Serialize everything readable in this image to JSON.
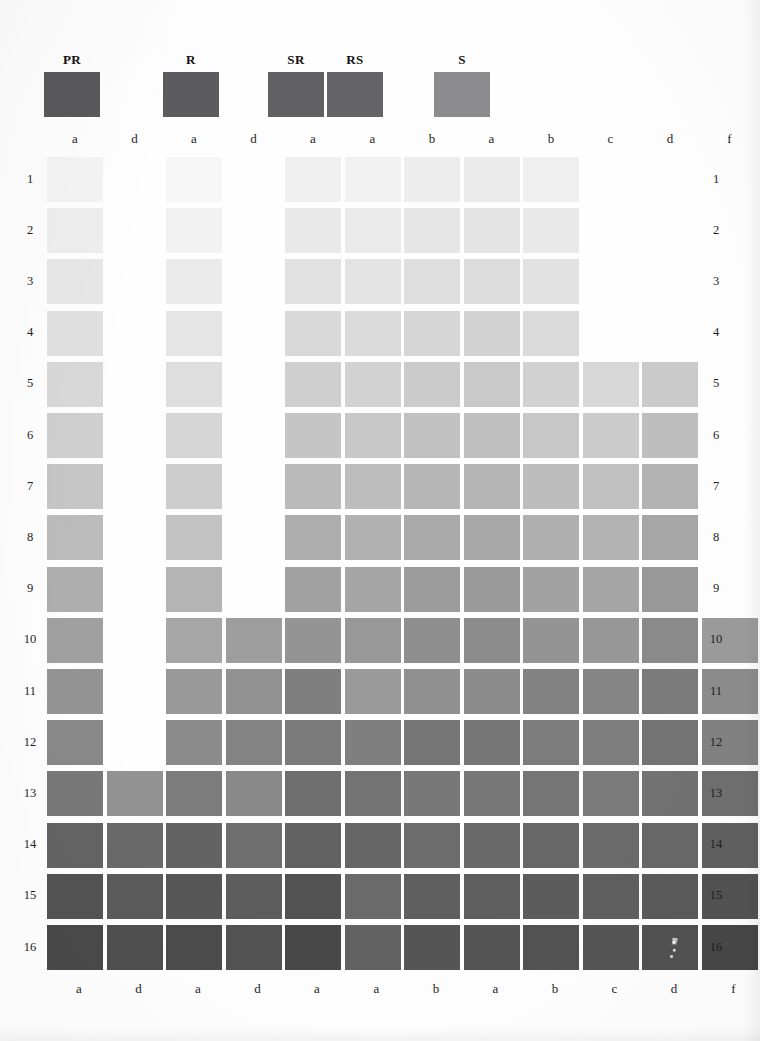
{
  "page": {
    "background": "#fefefe"
  },
  "header": {
    "swatches": [
      {
        "label": "PR",
        "color": "#59595b",
        "x": 44,
        "y": 72,
        "width": 56,
        "height": 45
      },
      {
        "label": "R",
        "color": "#5c5c5e",
        "x": 163,
        "y": 72,
        "width": 56,
        "height": 45
      },
      {
        "label": "SR",
        "color": "#616163",
        "x": 268,
        "y": 72,
        "width": 56,
        "height": 45
      },
      {
        "label": "RS",
        "color": "#646466",
        "x": 327,
        "y": 72,
        "width": 56,
        "height": 45
      },
      {
        "label": "S",
        "color": "#8c8c8e",
        "x": 434,
        "y": 72,
        "width": 56,
        "height": 45
      }
    ]
  },
  "grid": {
    "origin_x": 47,
    "origin_y": 157,
    "cell_width": 56,
    "cell_height": 45,
    "col_pitch": 59.5,
    "row_pitch": 51.2,
    "columns": [
      {
        "index": 1,
        "label": "a"
      },
      {
        "index": 2,
        "label": "d"
      },
      {
        "index": 3,
        "label": "a"
      },
      {
        "index": 4,
        "label": "d"
      },
      {
        "index": 5,
        "label": "a"
      },
      {
        "index": 6,
        "label": "a"
      },
      {
        "index": 7,
        "label": "b"
      },
      {
        "index": 8,
        "label": "a"
      },
      {
        "index": 9,
        "label": "b"
      },
      {
        "index": 10,
        "label": "c"
      },
      {
        "index": 11,
        "label": "d"
      },
      {
        "index": 12,
        "label": "f"
      }
    ],
    "rows": [
      {
        "index": 1,
        "label": "1"
      },
      {
        "index": 2,
        "label": "2"
      },
      {
        "index": 3,
        "label": "3"
      },
      {
        "index": 4,
        "label": "4"
      },
      {
        "index": 5,
        "label": "5"
      },
      {
        "index": 6,
        "label": "6"
      },
      {
        "index": 7,
        "label": "7"
      },
      {
        "index": 8,
        "label": "8"
      },
      {
        "index": 9,
        "label": "9"
      },
      {
        "index": 10,
        "label": "10"
      },
      {
        "index": 11,
        "label": "11"
      },
      {
        "index": 12,
        "label": "12"
      },
      {
        "index": 13,
        "label": "13"
      },
      {
        "index": 14,
        "label": "14"
      },
      {
        "index": 15,
        "label": "15"
      },
      {
        "index": 16,
        "label": "16"
      }
    ]
  },
  "chart_data": {
    "type": "heatmap",
    "xlabel": "",
    "ylabel": "",
    "grid": false,
    "legend_position": "top",
    "categories": [
      "a",
      "d",
      "a",
      "d",
      "a",
      "a",
      "b",
      "a",
      "b",
      "c",
      "d",
      "f"
    ],
    "row_labels": [
      "1",
      "2",
      "3",
      "4",
      "5",
      "6",
      "7",
      "8",
      "9",
      "10",
      "11",
      "12",
      "13",
      "14",
      "15",
      "16"
    ],
    "legend_entries": [
      {
        "name": "PR",
        "color": "#59595b"
      },
      {
        "name": "R",
        "color": "#5c5c5e"
      },
      {
        "name": "SR",
        "color": "#616163"
      },
      {
        "name": "RS",
        "color": "#646466"
      },
      {
        "name": "S",
        "color": "#8c8c8e"
      }
    ],
    "note": "Each matrix entry is a printed gray patch; null means no patch printed at that row/column.",
    "cells": [
      [
        "#f4f4f4",
        null,
        "#f6f6f6",
        null,
        "#f0f0f0",
        "#f1f1f1",
        "#ededed",
        "#ebebeb",
        "#efefef",
        null,
        null,
        null
      ],
      [
        "#eeeeee",
        null,
        "#f2f2f2",
        null,
        "#e9e9e9",
        "#eaeaea",
        "#e6e6e6",
        "#e4e4e4",
        "#e9e9e9",
        null,
        null,
        null
      ],
      [
        "#e7e7e7",
        null,
        "#ebebeb",
        null,
        "#e1e1e1",
        "#e3e3e3",
        "#dedede",
        "#dcdcdc",
        "#e2e2e2",
        null,
        null,
        null
      ],
      [
        "#e0e0e0",
        null,
        "#e5e5e5",
        null,
        "#d9d9d9",
        "#dbdbdb",
        "#d5d5d5",
        "#d3d3d3",
        "#dadada",
        null,
        null,
        null
      ],
      [
        "#d8d8d8",
        null,
        "#dedede",
        null,
        "#cfcfcf",
        "#d2d2d2",
        "#cbcbcb",
        "#c9c9c9",
        "#d1d1d1",
        "#d7d7d7",
        "#cacaca",
        null
      ],
      [
        "#cfcfcf",
        null,
        "#d6d6d6",
        null,
        "#c5c5c5",
        "#c8c8c8",
        "#c1c1c1",
        "#bfbfbf",
        "#c7c7c7",
        "#cbcbcb",
        "#bebebe",
        null
      ],
      [
        "#c6c6c6",
        null,
        "#cdcdcd",
        null,
        "#bababa",
        "#bdbdbd",
        "#b6b6b6",
        "#b4b4b4",
        "#bcbcbc",
        "#c0c0c0",
        "#b2b2b2",
        null
      ],
      [
        "#bbbbbb",
        null,
        "#c2c2c2",
        null,
        "#aeaeae",
        "#b1b1b1",
        "#aaaaaa",
        "#a8a8a8",
        "#b0b0b0",
        "#b3b3b3",
        "#a6a6a6",
        null
      ],
      [
        "#aeaeae",
        null,
        "#b4b4b4",
        null,
        "#a1a1a1",
        "#a5a5a5",
        "#9c9c9c",
        "#9b9b9b",
        "#a2a2a2",
        "#a5a5a5",
        "#989898",
        null
      ],
      [
        "#a0a0a0",
        null,
        "#a6a6a6",
        "#9d9d9d",
        "#949494",
        "#989898",
        "#8e8e8e",
        "#8d8d8d",
        "#949494",
        "#979797",
        "#8a8a8a",
        "#9b9b9b"
      ],
      [
        "#949494",
        null,
        "#999999",
        "#919191",
        "#7f7f7f",
        "#9a9a9a",
        "#909090",
        "#8b8b8b",
        "#828282",
        "#858585",
        "#7b7b7b",
        "#8c8c8c"
      ],
      [
        "#888888",
        null,
        "#8b8b8b",
        "#838383",
        "#7b7b7b",
        "#7f7f7f",
        "#757575",
        "#767676",
        "#7c7c7c",
        "#7e7e7e",
        "#737373",
        "#818181"
      ],
      [
        "#787878",
        "#929292",
        "#7c7c7c",
        "#898989",
        "#6e6e6e",
        "#737373",
        "#787878",
        "#787878",
        "#757575",
        "#7b7b7b",
        "#727272",
        "#6f6f6f"
      ],
      [
        "#646464",
        "#6a6a6a",
        "#636363",
        "#6e6e6e",
        "#626262",
        "#666666",
        "#6c6c6c",
        "#6a6a6a",
        "#676767",
        "#6b6b6b",
        "#686868",
        "#606060"
      ],
      [
        "#535353",
        "#5b5b5b",
        "#565656",
        "#5d5d5d",
        "#525252",
        "#6b6b6b",
        "#5f5f5f",
        "#5e5e5e",
        "#5c5c5c",
        "#5f5f5f",
        "#5a5a5a",
        "#525252"
      ],
      [
        "#494949",
        "#4f4f4f",
        "#4b4b4b",
        "#525252",
        "#484848",
        "#626262",
        "#555555",
        "#545454",
        "#525252",
        "#555555",
        "#515151",
        "#474747"
      ]
    ]
  }
}
